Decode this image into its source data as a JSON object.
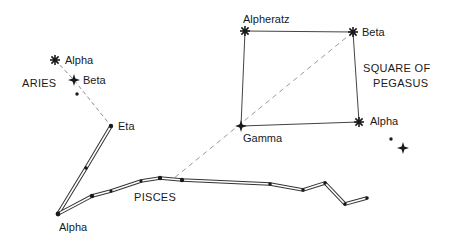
{
  "diagram": {
    "type": "star-chart",
    "constellations": [
      {
        "name": "ARIES",
        "label_pos": [
          22,
          87
        ]
      },
      {
        "name": "PISCES",
        "label_pos": [
          134,
          201
        ]
      },
      {
        "name_lines": [
          "SQUARE OF",
          "PEGASUS"
        ],
        "label_pos": [
          [
            363,
            72
          ],
          [
            373,
            87
          ]
        ]
      }
    ],
    "stars": [
      {
        "id": "aries-alpha",
        "label": "Alpha",
        "x": 55,
        "y": 60,
        "type": "bright",
        "label_pos": [
          65,
          64
        ]
      },
      {
        "id": "aries-beta",
        "label": "Beta",
        "x": 74,
        "y": 80,
        "type": "bright4",
        "label_pos": [
          83,
          84
        ]
      },
      {
        "id": "aries-dot",
        "label": "",
        "x": 77,
        "y": 94,
        "type": "dot"
      },
      {
        "id": "pisces-eta",
        "label": "Eta",
        "x": 111,
        "y": 126,
        "type": "dot",
        "label_pos": [
          118,
          130
        ]
      },
      {
        "id": "pisces-alpha",
        "label": "Alpha",
        "x": 58,
        "y": 214,
        "type": "dot",
        "label_pos": [
          59,
          231
        ]
      },
      {
        "id": "alpheratz",
        "label": "Alpheratz",
        "x": 245,
        "y": 31,
        "type": "bright",
        "label_pos": [
          243,
          23
        ]
      },
      {
        "id": "pegasus-beta",
        "label": "Beta",
        "x": 353,
        "y": 32,
        "type": "bright",
        "label_pos": [
          362,
          36
        ]
      },
      {
        "id": "pegasus-gamma",
        "label": "Gamma",
        "x": 241,
        "y": 126,
        "type": "bright4",
        "label_pos": [
          243,
          142
        ]
      },
      {
        "id": "pegasus-alpha",
        "label": "Alpha",
        "x": 359,
        "y": 122,
        "type": "bright",
        "label_pos": [
          370,
          125
        ]
      },
      {
        "id": "extra-dot",
        "label": "",
        "x": 391,
        "y": 139,
        "type": "dot"
      },
      {
        "id": "extra-star",
        "label": "",
        "x": 403,
        "y": 148,
        "type": "bright4"
      }
    ],
    "solid_lines": [
      {
        "from": "alpheratz",
        "to": "pegasus-beta"
      },
      {
        "from": "pegasus-beta",
        "to": "pegasus-alpha"
      },
      {
        "from": "pegasus-alpha",
        "to": "pegasus-gamma"
      },
      {
        "from": "pegasus-gamma",
        "to": "alpheratz"
      }
    ],
    "dashed_lines": [
      {
        "points": [
          [
            55,
            60
          ],
          [
            74,
            80
          ],
          [
            111,
            126
          ]
        ]
      },
      {
        "points": [
          [
            353,
            32
          ],
          [
            173,
            179
          ]
        ]
      }
    ],
    "double_lines": [
      {
        "points": [
          [
            111,
            126
          ],
          [
            86,
            168
          ],
          [
            58,
            214
          ]
        ]
      },
      {
        "points": [
          [
            58,
            214
          ],
          [
            92,
            196
          ],
          [
            111,
            191
          ],
          [
            141,
            181
          ],
          [
            160,
            178
          ],
          [
            182,
            180
          ],
          [
            270,
            184
          ],
          [
            303,
            190
          ],
          [
            325,
            183
          ],
          [
            345,
            204
          ],
          [
            367,
            198
          ]
        ]
      }
    ],
    "chain_dots": [
      [
        86,
        168
      ],
      [
        92,
        196
      ],
      [
        111,
        191
      ],
      [
        141,
        181
      ],
      [
        160,
        178
      ],
      [
        182,
        180
      ],
      [
        270,
        184
      ],
      [
        303,
        190
      ],
      [
        325,
        183
      ],
      [
        345,
        204
      ],
      [
        367,
        198
      ]
    ],
    "labels": {
      "aries": "ARIES",
      "pisces": "PISCES",
      "square_line1": "SQUARE OF",
      "square_line2": "PEGASUS",
      "aries_alpha": "Alpha",
      "aries_beta": "Beta",
      "eta": "Eta",
      "pisces_alpha": "Alpha",
      "alpheratz": "Alpheratz",
      "pegasus_beta": "Beta",
      "gamma": "Gamma",
      "pegasus_alpha": "Alpha"
    },
    "colors": {
      "ink": "#1a1a1a",
      "dash": "#9a9a9a",
      "line": "#444444",
      "background": "#ffffff"
    }
  }
}
